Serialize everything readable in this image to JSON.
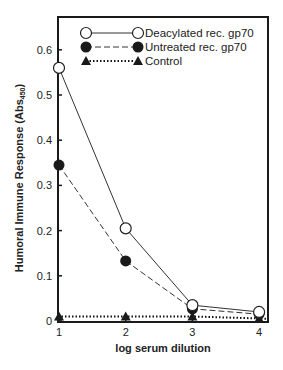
{
  "chart_data": {
    "type": "line",
    "title": "",
    "xlabel": "log serum dilution",
    "ylabel": "Humoral Immune Response (Abs450)",
    "ylabel_main": "Humoral Immune Response (Abs",
    "ylabel_sub": "450",
    "ylabel_close": ")",
    "x": [
      1,
      2,
      3,
      4
    ],
    "xticks": [
      "1",
      "2",
      "3",
      "4"
    ],
    "yticks": [
      "0",
      "0.1",
      "0.2",
      "0.3",
      "0.4",
      "0.5",
      "0.6"
    ],
    "ylim": [
      0,
      0.66
    ],
    "xlim": [
      1,
      4.05
    ],
    "grid": false,
    "legend_position": "upper right",
    "series": [
      {
        "name": "Deacylated rec. gp70",
        "marker": "open-circle",
        "line": "solid",
        "values": [
          0.56,
          0.205,
          0.035,
          0.02
        ]
      },
      {
        "name": "Untreated rec. gp70",
        "marker": "filled-circle",
        "line": "dashed",
        "values": [
          0.345,
          0.133,
          0.027,
          0.015
        ]
      },
      {
        "name": "Control",
        "marker": "filled-triangle",
        "line": "dotted",
        "values": [
          0.01,
          0.01,
          0.01,
          0.005
        ]
      }
    ]
  }
}
